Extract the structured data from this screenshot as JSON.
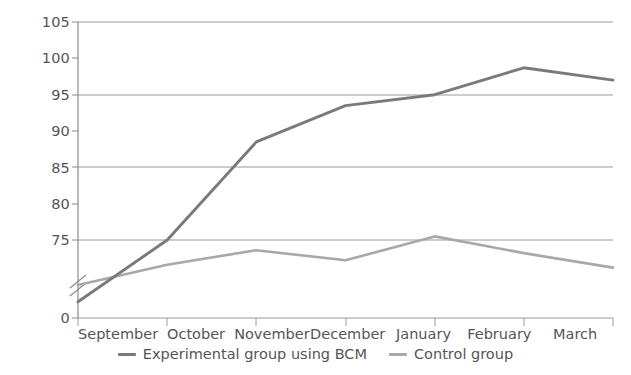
{
  "chart_data": {
    "type": "line",
    "title": "",
    "subtitle": "",
    "xlabel": "",
    "ylabel": "",
    "categories": [
      "September",
      "October",
      "November",
      "December",
      "January",
      "February",
      "March"
    ],
    "series": [
      {
        "name": "Experimental group using BCM",
        "color": "#7a7a7a",
        "values": [
          66.5,
          75.0,
          88.5,
          93.5,
          95.0,
          98.7,
          97.0
        ]
      },
      {
        "name": "Control group",
        "color": "#a8a8a8",
        "values": [
          68.8,
          71.6,
          73.6,
          72.2,
          75.5,
          73.2,
          71.2
        ]
      }
    ],
    "yticks": [
      0,
      75,
      80,
      85,
      90,
      95,
      100,
      105
    ],
    "ytick_labels": [
      "0",
      "75",
      "80",
      "85",
      "90",
      "95",
      "100",
      "105"
    ],
    "gridlines": [
      75,
      85,
      95,
      105
    ],
    "ylim": [
      0,
      105
    ],
    "axis_break": true,
    "axis_break_label": "axis-break-marks",
    "grid": true,
    "legend_position": "bottom",
    "legend_entries": [
      "Experimental group using BCM",
      "Control group"
    ]
  },
  "style": {
    "grid_color": "#9a9a9a",
    "axis_color": "#8a8a8a",
    "text_color": "#555555",
    "background": "#ffffff",
    "series_1_color": "#7a7a7a",
    "series_2_color": "#a8a8a8"
  }
}
